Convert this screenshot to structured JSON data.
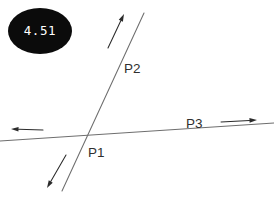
{
  "canvas": {
    "width": 274,
    "height": 198,
    "background": "#ffffff"
  },
  "badge": {
    "value": "4.51",
    "shape": "ellipse",
    "fill_color": "#0b0b0b",
    "text_color": "#ffffff",
    "center_x": 40,
    "center_y": 31,
    "radius_x": 32,
    "radius_y": 23
  },
  "labels": {
    "p1": "P1",
    "p2": "P2",
    "p3": "P3"
  },
  "chart_data": {
    "type": "diagram",
    "title": "",
    "subtitle": "",
    "xlabel": "",
    "ylabel": "",
    "grid": false,
    "legend": "none",
    "annotations": [
      {
        "name": "badge-value",
        "text": "4.51",
        "x": 40,
        "y": 31,
        "style": "white-on-black-ellipse"
      },
      {
        "name": "label-p2",
        "text": "P2",
        "x": 124,
        "y": 73,
        "style": "plain"
      },
      {
        "name": "label-p1",
        "text": "P1",
        "x": 88,
        "y": 157,
        "style": "plain"
      },
      {
        "name": "label-p3",
        "text": "P3",
        "x": 186,
        "y": 128,
        "style": "plain"
      }
    ],
    "lines": [
      {
        "name": "line-p2",
        "label": "P2",
        "x1": 62,
        "y1": 191,
        "x2": 144,
        "y2": 13,
        "color": "#6e6e6e",
        "direction": "lower-left to upper-right"
      },
      {
        "name": "line-p3",
        "label": "P3",
        "x1": 0,
        "y1": 141,
        "x2": 274,
        "y2": 123,
        "color": "#6e6e6e",
        "direction": "left to right, slightly rising"
      }
    ],
    "arrows": [
      {
        "name": "arrow-p2-up",
        "belongs_to": "P2",
        "x1": 108,
        "y1": 48,
        "x2": 124,
        "y2": 14,
        "points": "up-right",
        "color": "#2b2b2b"
      },
      {
        "name": "arrow-p2-down",
        "belongs_to": "P2",
        "x1": 66,
        "y1": 155,
        "x2": 47,
        "y2": 188,
        "points": "down-left",
        "color": "#2b2b2b"
      },
      {
        "name": "arrow-p3-right",
        "belongs_to": "P3",
        "x1": 221,
        "y1": 122,
        "x2": 257,
        "y2": 120,
        "points": "right",
        "color": "#2b2b2b"
      },
      {
        "name": "arrow-p3-left",
        "belongs_to": "P3",
        "x1": 43,
        "y1": 130,
        "x2": 11,
        "y2": 129,
        "points": "left",
        "color": "#2b2b2b"
      }
    ],
    "intersection": {
      "name": "P1",
      "x": 80,
      "y": 138,
      "description": "intersection of line P2 and line P3"
    }
  }
}
